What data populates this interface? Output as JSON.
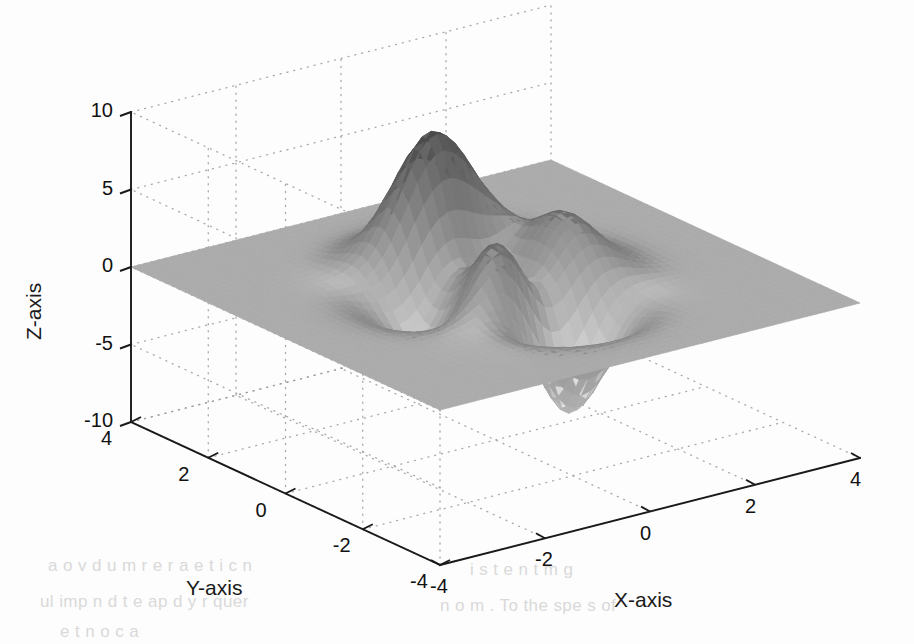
{
  "figure": {
    "kind": "matlab-peaks-surface",
    "background": "#fdfdfd",
    "axis_color": "#1a1a1a",
    "grid_color": "#9a9a9a",
    "surface_light": "#f2f2f2",
    "surface_mid": "#adadad",
    "surface_dark": "#3a3a3a"
  },
  "labels": {
    "x_axis": "X-axis",
    "y_axis": "Y-axis",
    "z_axis": "Z-axis"
  },
  "ticks": {
    "x": [
      "-4",
      "-2",
      "0",
      "2",
      "4"
    ],
    "y": [
      "4",
      "2",
      "0",
      "-2",
      "-4"
    ],
    "z": [
      "-10",
      "-5",
      "0",
      "5",
      "10"
    ]
  },
  "chart_data": {
    "type": "surface",
    "title": "",
    "xlabel": "X-axis",
    "ylabel": "Y-axis",
    "zlabel": "Z-axis",
    "xlim": [
      -4,
      4
    ],
    "ylim": [
      -4,
      4
    ],
    "zlim": [
      -10,
      10
    ],
    "xticks": [
      -4,
      -2,
      0,
      2,
      4
    ],
    "yticks": [
      -4,
      -2,
      0,
      2,
      4
    ],
    "zticks": [
      -10,
      -5,
      0,
      5,
      10
    ],
    "grid": true,
    "legend": "none",
    "colormap": "gray-inverted",
    "function": "peaks",
    "formula": "z = 3*(1-x)^2*exp(-x^2-(y+1)^2) - 10*(x/5 - x^3 - y^5)*exp(-x^2-y^2) - (1/3)*exp(-(x+1)^2 - y^2)",
    "z_range_observed": [
      -6.55,
      8.08
    ],
    "features": [
      {
        "name": "global-maximum",
        "x": -0.01,
        "y": 1.58,
        "z": 8.08
      },
      {
        "name": "global-minimum",
        "x": 0.23,
        "y": -1.63,
        "z": -6.55
      },
      {
        "name": "secondary-maximum",
        "x": 1.29,
        "y": -0.01,
        "z": 3.78
      },
      {
        "name": "secondary-minimum",
        "x": -1.35,
        "y": 0.2,
        "z": -3.05
      },
      {
        "name": "small-dimple",
        "x": -1.0,
        "y": 0.0,
        "z": -0.33
      }
    ],
    "view": {
      "azimuth": -37.5,
      "elevation": 30
    },
    "grid_resolution": 49
  }
}
